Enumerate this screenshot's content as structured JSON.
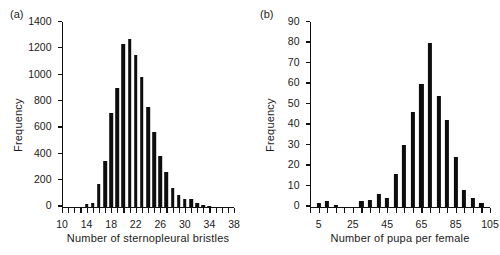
{
  "figure": {
    "background": "#ffffff",
    "bar_color": "#0d0d0d",
    "axis_color": "#111111"
  },
  "panels": [
    {
      "tag": "(a)",
      "chart_data": {
        "type": "bar",
        "title": "",
        "xlabel": "Number of sternopleural bristles",
        "ylabel": "Frequency",
        "xlim": [
          10,
          38
        ],
        "ylim": [
          0,
          1400
        ],
        "xticks": [
          10,
          14,
          18,
          22,
          26,
          30,
          34,
          38
        ],
        "xtick_labels": [
          "10",
          "14",
          "18",
          "22",
          "26",
          "30",
          "34",
          "38"
        ],
        "xtick_minor_step": 1,
        "yticks": [
          0,
          200,
          400,
          600,
          800,
          1000,
          1200,
          1400
        ],
        "ytick_labels": [
          "0",
          "200",
          "400",
          "600",
          "800",
          "1000",
          "1200",
          "1400"
        ],
        "grid": false,
        "legend": "none",
        "categories": [
          10,
          11,
          12,
          13,
          14,
          15,
          16,
          17,
          18,
          19,
          20,
          21,
          22,
          23,
          24,
          25,
          26,
          27,
          28,
          29,
          30,
          31,
          32,
          33,
          34,
          35,
          36,
          37,
          38
        ],
        "values": [
          0,
          0,
          0,
          0,
          20,
          30,
          175,
          345,
          710,
          900,
          1230,
          1270,
          1150,
          980,
          755,
          565,
          385,
          260,
          140,
          90,
          60,
          55,
          25,
          15,
          5,
          0,
          0,
          0,
          0
        ]
      }
    },
    {
      "tag": "(b)",
      "chart_data": {
        "type": "bar",
        "title": "",
        "xlabel": "Number of pupa per female",
        "ylabel": "Frequency",
        "xlim": [
          0,
          105
        ],
        "ylim": [
          0,
          90
        ],
        "xticks": [
          5,
          25,
          45,
          65,
          85,
          105
        ],
        "xtick_labels": [
          "5",
          "25",
          "45",
          "65",
          "85",
          "105"
        ],
        "xtick_minor_step": 5,
        "yticks": [
          0,
          10,
          20,
          30,
          40,
          50,
          60,
          70,
          80,
          90
        ],
        "ytick_labels": [
          "0",
          "10",
          "20",
          "30",
          "40",
          "50",
          "60",
          "70",
          "80",
          "90"
        ],
        "grid": false,
        "legend": "none",
        "categories": [
          5,
          10,
          15,
          20,
          25,
          30,
          35,
          40,
          45,
          50,
          55,
          60,
          65,
          70,
          75,
          80,
          85,
          90,
          95,
          100
        ],
        "values": [
          1.8,
          2.6,
          0.9,
          0,
          0,
          2.6,
          3.0,
          6.0,
          4.0,
          16.0,
          30.0,
          46.0,
          60.0,
          80.0,
          54.0,
          42.0,
          24.0,
          8.0,
          4.0,
          1.8
        ]
      }
    }
  ]
}
